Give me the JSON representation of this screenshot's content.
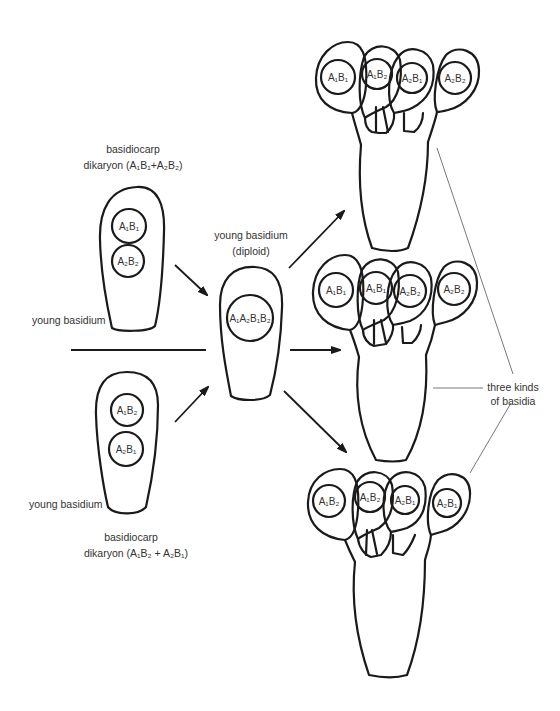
{
  "labels": {
    "top_basidiocarp": "basidiocarp",
    "top_dikaryon": "dikaryon (A₁B₁+A₂B₂)",
    "top_young_basidium": "young basidium",
    "bottom_young_basidium": "young basidium",
    "bottom_basidiocarp": "basidiocarp",
    "bottom_dikaryon": "dikaryon (A₁B₂ + A₂B₁)",
    "center_young_basidium": "young basidium",
    "center_diploid": "(diploid)",
    "three_kinds_line1": "three kinds",
    "three_kinds_line2": "of basidia"
  },
  "nuclei": {
    "top_parent": [
      "A₁B₁",
      "A₂B₂"
    ],
    "bottom_parent": [
      "A₁B₂",
      "A₂B₁"
    ],
    "diploid": "A₁A₂B₁B₂",
    "basidium_1": [
      "A₁B₁",
      "A₁B₂",
      "A₂B₁",
      "A₂B₂"
    ],
    "basidium_2": [
      "A₁B₁",
      "A₁B₁",
      "A₂B₂",
      "A₂B₂"
    ],
    "basidium_3": [
      "A₁B₂",
      "A₁B₂",
      "A₂B₁",
      "A₂B₁"
    ]
  },
  "colors": {
    "stroke": "#1a1a1a",
    "text": "#333333",
    "background": "#ffffff"
  }
}
